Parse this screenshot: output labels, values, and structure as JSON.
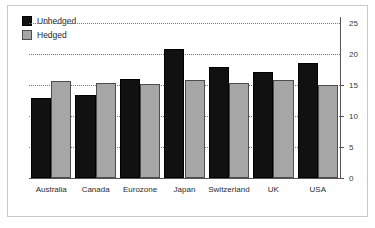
{
  "chart_data": {
    "type": "bar",
    "title": "",
    "xlabel": "",
    "ylabel": "",
    "categories": [
      "Australia",
      "Canada",
      "Eurozone",
      "Japan",
      "Switzerland",
      "UK",
      "USA"
    ],
    "series": [
      {
        "name": "Unhedged",
        "color": "#111111",
        "values": [
          12.9,
          13.4,
          16.0,
          20.8,
          17.9,
          17.1,
          18.6
        ]
      },
      {
        "name": "Hedged",
        "color": "#a6a6a6",
        "values": [
          15.6,
          15.4,
          15.2,
          15.8,
          15.4,
          15.8,
          15.1
        ]
      }
    ],
    "ylim": [
      0,
      26
    ],
    "yticks": [
      0,
      5,
      10,
      15,
      20,
      25
    ],
    "ytick_labels": [
      "0",
      "5",
      "10",
      "15",
      "20",
      "25"
    ],
    "gridlines": [
      5,
      10,
      15,
      20,
      25
    ],
    "grid": true,
    "grid_style": "dotted",
    "y_axis_position": "right",
    "legend": {
      "position": "top-left",
      "entries": [
        {
          "label": "Unhedged",
          "color": "#111111"
        },
        {
          "label": "Hedged",
          "color": "#a6a6a6"
        }
      ]
    },
    "frame_color": "#c8c8c8",
    "background": "#ffffff"
  }
}
